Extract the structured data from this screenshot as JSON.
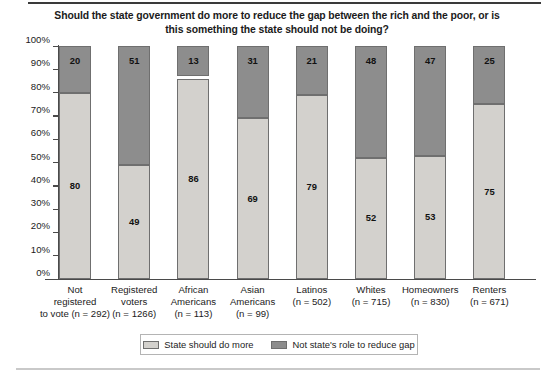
{
  "chart_data": {
    "type": "bar",
    "stacked": true,
    "stacked_percent": true,
    "title": "Should the state government do more to reduce the gap between the rich and the poor, or is this something the state should not be doing?",
    "xlabel": "",
    "ylabel": "",
    "ylim": [
      0,
      100
    ],
    "ytick_labels": [
      "100%",
      "90%",
      "80%",
      "70%",
      "60%",
      "50%",
      "40%",
      "30%",
      "20%",
      "10%",
      "0%"
    ],
    "ytick_values": [
      100,
      90,
      80,
      70,
      60,
      50,
      40,
      30,
      20,
      10,
      0
    ],
    "grid": false,
    "legend_position": "bottom",
    "categories": [
      "Not registered to vote (n = 292)",
      "Registered voters (n = 1266)",
      "African Americans (n = 113)",
      "Asian Americans (n = 99)",
      "Latinos (n = 502)",
      "Whites (n = 715)",
      "Homeowners (n = 830)",
      "Renters (n = 671)"
    ],
    "category_lines": [
      "Not\nregistered\nto vote (n = 292)",
      "Registered\nvoters\n(n = 1266)",
      "African\nAmericans\n(n = 113)",
      "Asian\nAmericans\n(n = 99)",
      "Latinos\n(n = 502)",
      "Whites\n(n = 715)",
      "Homeowners\n(n = 830)",
      "Renters\n(n = 671)"
    ],
    "sample_sizes": [
      292,
      1266,
      113,
      99,
      502,
      715,
      830,
      671
    ],
    "series": [
      {
        "name": "State should do more",
        "color": "#d3d1cd",
        "values": [
          80,
          49,
          86,
          69,
          79,
          52,
          53,
          75
        ]
      },
      {
        "name": "Not state's role to reduce gap",
        "color": "#8d8d8d",
        "values": [
          20,
          51,
          13,
          31,
          21,
          48,
          47,
          25
        ]
      }
    ]
  },
  "legend": {
    "items": [
      {
        "label": "State should do more",
        "swatch": "light"
      },
      {
        "label": "Not state's role to reduce gap",
        "swatch": "dark"
      }
    ]
  }
}
